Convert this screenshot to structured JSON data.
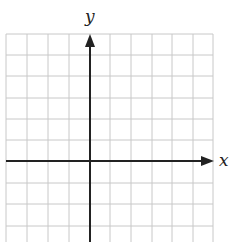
{
  "diagram": {
    "type": "coordinate-plane",
    "x_axis_label": "x",
    "y_axis_label": "y",
    "grid": {
      "left": 6,
      "right": 213,
      "top": 34,
      "bottom": 242,
      "vertical_lines": [
        6,
        27,
        48,
        69,
        110,
        131,
        152,
        172,
        193,
        213
      ],
      "horizontal_lines": [
        34,
        55,
        76,
        98,
        119,
        140,
        183,
        204,
        226
      ]
    },
    "origin": {
      "x": 90,
      "y": 161
    },
    "colors": {
      "grid": "#c8c8c8",
      "axis": "#222222",
      "background": "#ffffff"
    }
  }
}
